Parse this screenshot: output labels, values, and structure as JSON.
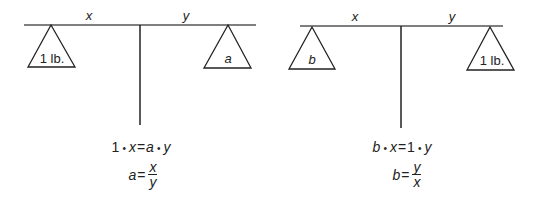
{
  "scales": [
    {
      "id": "left",
      "arm_labels": {
        "left": "x",
        "right": "y"
      },
      "weights": {
        "left": "1 lb.",
        "right": "a"
      },
      "equations": {
        "line1": {
          "lhs_coef": "1",
          "lhs_var": "x",
          "rhs_coef": "a",
          "rhs_var": "y"
        },
        "line2": {
          "var": "a",
          "num": "x",
          "den": "y"
        }
      }
    },
    {
      "id": "right",
      "arm_labels": {
        "left": "x",
        "right": "y"
      },
      "weights": {
        "left": "b",
        "right": "1 lb."
      },
      "equations": {
        "line1": {
          "lhs_coef": "b",
          "lhs_var": "x",
          "rhs_coef": "1",
          "rhs_var": "y"
        },
        "line2": {
          "var": "b",
          "num": "y",
          "den": "x"
        }
      }
    }
  ],
  "symbols": {
    "dot": "•",
    "equals": "="
  },
  "colors": {
    "stroke": "#222222",
    "beam": "#555555"
  }
}
